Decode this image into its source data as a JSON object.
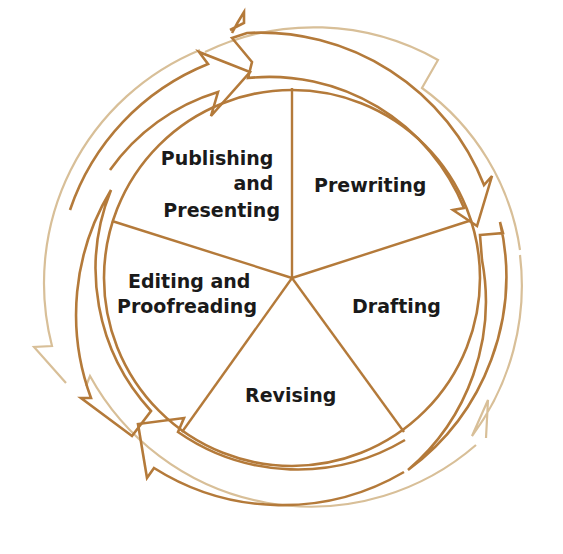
{
  "diagram": {
    "type": "cycle",
    "title": "",
    "center": [
      292,
      278
    ],
    "colors": {
      "stroke": "#b47a3a",
      "faded_stroke": "#d8bf98",
      "text": "#1a1a1a",
      "background": "#ffffff"
    },
    "segments": [
      {
        "id": "prewriting",
        "lines": [
          "Prewriting"
        ]
      },
      {
        "id": "drafting",
        "lines": [
          "Drafting"
        ]
      },
      {
        "id": "revising",
        "lines": [
          "Revising"
        ]
      },
      {
        "id": "editing",
        "lines": [
          "Editing and",
          "Proofreading"
        ]
      },
      {
        "id": "publishing",
        "lines": [
          "Publishing",
          "and",
          "Presenting"
        ]
      }
    ],
    "flow": "clockwise"
  }
}
